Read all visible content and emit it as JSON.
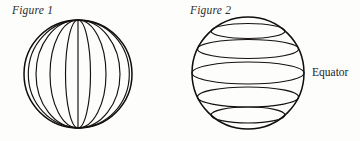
{
  "page": {
    "background_color": "#fdfdfb",
    "ink_color": "#14110f",
    "width": 360,
    "height": 141
  },
  "figures": [
    {
      "id": "figure-1",
      "label": "Figure 1",
      "subject": "sphere-with-meridians",
      "description": "Globe drawn with vertical longitude lines (meridians)",
      "center": {
        "x": 78,
        "y": 74
      },
      "radius": 54,
      "line_count": 9,
      "line_type": "meridian",
      "meridian_rx_fractions": [
        1.0,
        0.78,
        0.52,
        0.22
      ]
    },
    {
      "id": "figure-2",
      "label": "Figure 2",
      "subject": "sphere-with-parallels",
      "description": "Globe drawn with horizontal latitude lines (parallels)",
      "center": {
        "x": 248,
        "y": 73
      },
      "radius": 56,
      "line_count": 5,
      "line_type": "parallel",
      "parallel_offsets": [
        -42,
        -24,
        0,
        24,
        42
      ],
      "annotation": {
        "text": "Equator",
        "target_parallel_index": 2,
        "x": 312,
        "y": 66
      }
    }
  ],
  "colors": {
    "ink": "#14110f",
    "paper": "#fdfdfb",
    "label_text": "#2b2b2b"
  }
}
